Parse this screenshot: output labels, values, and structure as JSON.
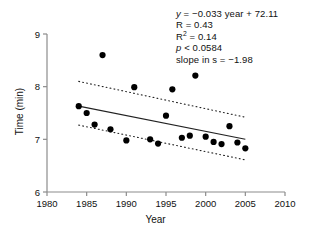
{
  "chart_data": {
    "type": "scatter",
    "title": "",
    "xlabel": "Year",
    "ylabel": "Time (min)",
    "xlim": [
      1980,
      2010
    ],
    "ylim": [
      6,
      9
    ],
    "xticks": [
      1980,
      1985,
      1990,
      1995,
      2000,
      2005,
      2010
    ],
    "yticks": [
      6,
      7,
      8,
      9
    ],
    "grid": false,
    "legend": "none",
    "marker_color": "#000000",
    "line_color": "#222222",
    "points": [
      {
        "x": 1984.0,
        "y": 7.63
      },
      {
        "x": 1985.0,
        "y": 7.5
      },
      {
        "x": 1986.0,
        "y": 7.28
      },
      {
        "x": 1987.0,
        "y": 8.6
      },
      {
        "x": 1988.0,
        "y": 7.19
      },
      {
        "x": 1990.0,
        "y": 6.98
      },
      {
        "x": 1991.0,
        "y": 7.99
      },
      {
        "x": 1993.0,
        "y": 7.0
      },
      {
        "x": 1994.0,
        "y": 6.92
      },
      {
        "x": 1995.0,
        "y": 7.45
      },
      {
        "x": 1995.8,
        "y": 7.95
      },
      {
        "x": 1997.0,
        "y": 7.03
      },
      {
        "x": 1998.0,
        "y": 7.07
      },
      {
        "x": 1998.7,
        "y": 8.21
      },
      {
        "x": 2000.0,
        "y": 7.05
      },
      {
        "x": 2001.0,
        "y": 6.95
      },
      {
        "x": 2002.0,
        "y": 6.91
      },
      {
        "x": 2003.0,
        "y": 7.25
      },
      {
        "x": 2004.0,
        "y": 6.94
      },
      {
        "x": 2005.0,
        "y": 6.83
      }
    ],
    "regression_line": {
      "x": [
        1984,
        2005
      ],
      "y": [
        7.63,
        7.0
      ]
    },
    "confidence_upper": {
      "x": [
        1984,
        2005
      ],
      "y": [
        8.1,
        7.42
      ]
    },
    "confidence_lower": {
      "x": [
        1984,
        2005
      ],
      "y": [
        7.27,
        6.61
      ]
    },
    "annotations": {
      "equation_prefix": "y",
      "equation_rest": " = −0.033 year + 72.11",
      "r": "R = 0.43",
      "r2_prefix": "R",
      "r2_sup": "2",
      "r2_rest": " = 0.14",
      "p_prefix": "p",
      "p_rest": " < 0.0584",
      "slope": "slope in s = −1.98"
    }
  },
  "axis": {
    "x_title": "Year",
    "y_title": "Time (min)",
    "x_tick_labels": [
      "1980",
      "1985",
      "1990",
      "1995",
      "2000",
      "2005",
      "2010"
    ],
    "y_tick_labels": [
      "6",
      "7",
      "8",
      "9"
    ]
  }
}
